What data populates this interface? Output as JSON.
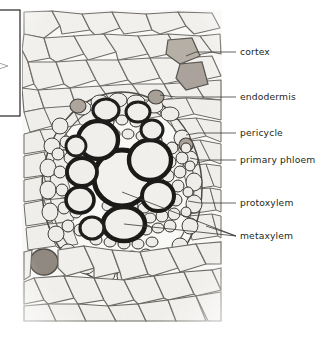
{
  "figure": {
    "type": "light-micrograph",
    "background_color": "#ffffff",
    "image_region": {
      "x": 22,
      "y": 10,
      "width": 200,
      "height": 312
    },
    "tissue_colors": {
      "cell_lumen": "#f2f1ee",
      "thin_wall": "#6f6c68",
      "thick_xylem_wall": "#161514",
      "stained_cell_tan": "#b3aca3",
      "stained_cell_dark": "#8d857c",
      "background_paper": "#fbfbfa"
    }
  },
  "crop_box": {
    "name": "crop-marker-box",
    "x": -16,
    "y": 10,
    "width": 36,
    "height": 106,
    "stroke": "#111111",
    "note": "partial rectangle outline clipped at left image edge"
  },
  "labels": [
    {
      "id": "cortex",
      "text": "cortex",
      "text_x": 240,
      "text_y": 52,
      "leader": [
        {
          "x": 236,
          "y": 52
        },
        {
          "x": 196,
          "y": 52
        },
        {
          "x": 186,
          "y": 56
        }
      ]
    },
    {
      "id": "endodermis",
      "text": "endodermis",
      "text_x": 240,
      "text_y": 97,
      "leader": [
        {
          "x": 236,
          "y": 97
        },
        {
          "x": 176,
          "y": 97
        },
        {
          "x": 160,
          "y": 95
        }
      ]
    },
    {
      "id": "pericycle",
      "text": "pericycle",
      "text_x": 240,
      "text_y": 133,
      "leader": [
        {
          "x": 236,
          "y": 133
        },
        {
          "x": 198,
          "y": 133
        },
        {
          "x": 186,
          "y": 135
        }
      ]
    },
    {
      "id": "primary-phloem",
      "text": "primary phloem",
      "text_x": 240,
      "text_y": 160,
      "leader": [
        {
          "x": 236,
          "y": 160
        },
        {
          "x": 200,
          "y": 160
        },
        {
          "x": 190,
          "y": 158
        }
      ]
    },
    {
      "id": "protoxylem",
      "text": "protoxylem",
      "text_x": 240,
      "text_y": 203,
      "leader": [
        {
          "x": 236,
          "y": 203
        },
        {
          "x": 200,
          "y": 203
        },
        {
          "x": 188,
          "y": 201
        }
      ]
    },
    {
      "id": "metaxylem",
      "text": "metaxylem",
      "text_x": 240,
      "text_y": 236,
      "leader_a": [
        {
          "x": 236,
          "y": 236
        },
        {
          "x": 122,
          "y": 192
        }
      ],
      "leader_b": [
        {
          "x": 236,
          "y": 236
        },
        {
          "x": 124,
          "y": 224
        }
      ],
      "leader_c": [
        {
          "x": 236,
          "y": 236
        },
        {
          "x": 206,
          "y": 226
        }
      ]
    }
  ]
}
